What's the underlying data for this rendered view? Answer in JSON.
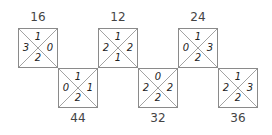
{
  "diagram": {
    "line_color": "#8a8a8a",
    "squares": [
      {
        "label": "16",
        "label_pos": "top",
        "top": "1",
        "left": "3",
        "right": "0",
        "bottom": "2"
      },
      {
        "label": "44",
        "label_pos": "bottom",
        "top": "1",
        "left": "0",
        "right": "1",
        "bottom": "2"
      },
      {
        "label": "12",
        "label_pos": "top",
        "top": "1",
        "left": "2",
        "right": "2",
        "bottom": "1"
      },
      {
        "label": "32",
        "label_pos": "bottom",
        "top": "0",
        "left": "2",
        "right": "2",
        "bottom": "2"
      },
      {
        "label": "24",
        "label_pos": "top",
        "top": "1",
        "left": "0",
        "right": "3",
        "bottom": "2"
      },
      {
        "label": "36",
        "label_pos": "bottom",
        "top": "1",
        "left": "2",
        "right": "3",
        "bottom": "2"
      }
    ]
  }
}
